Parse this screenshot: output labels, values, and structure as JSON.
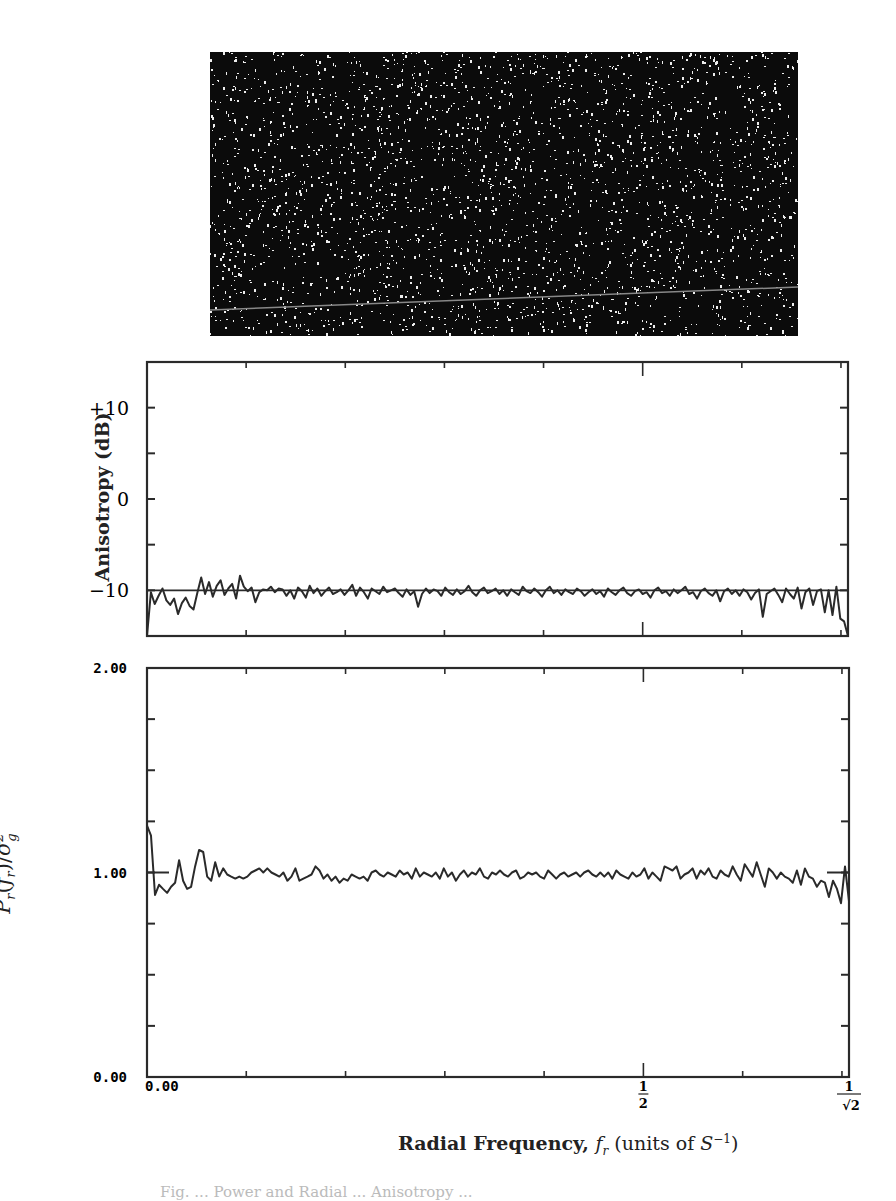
{
  "figure": {
    "image_panel": {
      "description": "random-dot noise texture (white speckles on black) with a faint gray diagonal line near the bottom"
    },
    "xlabel": "Radial Frequency, f_r (units of S^-1)",
    "xlabel_parts": {
      "main": "Radial Frequency, ",
      "var": "f",
      "sub": "r",
      "units_open": " (units of ",
      "unit_var": "S",
      "unit_sup": "−1",
      "units_close": ")"
    },
    "caption_partial": "Fig. ... Power and Radial ... Anisotropy ..."
  },
  "chart_data": [
    {
      "type": "line",
      "title": "",
      "ylabel": "Anisotropy (dB)",
      "xlabel": "",
      "ylim": [
        -15,
        15
      ],
      "xlim": [
        0,
        0.7071
      ],
      "yticks": [
        {
          "value": 10,
          "label": "+10"
        },
        {
          "value": 0,
          "label": "0"
        },
        {
          "value": -10,
          "label": "−10"
        }
      ],
      "yminor": [
        15,
        5,
        -5,
        -15
      ],
      "xticks": [
        0,
        0.1,
        0.2,
        0.3,
        0.4,
        0.5,
        0.6,
        0.7,
        0.7071
      ],
      "reference_line": -10,
      "series": [
        {
          "name": "anisotropy",
          "x_start": 0.0,
          "x_step": 0.00354,
          "values": [
            -15,
            -10.2,
            -11.5,
            -10.6,
            -9.8,
            -11.1,
            -11.6,
            -10.9,
            -12.6,
            -11.4,
            -10.8,
            -11.7,
            -12.1,
            -10.3,
            -8.6,
            -10.4,
            -9.1,
            -10.7,
            -9.5,
            -8.9,
            -10.5,
            -9.8,
            -9.3,
            -10.9,
            -8.4,
            -9.6,
            -10.1,
            -9.7,
            -11.3,
            -10.2,
            -9.9,
            -10.0,
            -9.6,
            -10.2,
            -9.8,
            -9.9,
            -10.6,
            -10.0,
            -10.9,
            -9.7,
            -10.1,
            -10.8,
            -9.5,
            -10.3,
            -9.8,
            -10.6,
            -10.1,
            -9.7,
            -10.4,
            -10.2,
            -9.9,
            -10.5,
            -10.0,
            -9.4,
            -10.6,
            -9.7,
            -10.2,
            -10.9,
            -9.8,
            -10.1,
            -10.4,
            -9.6,
            -10.2,
            -10.0,
            -9.8,
            -10.3,
            -10.7,
            -9.9,
            -10.5,
            -10.1,
            -11.8,
            -10.4,
            -9.8,
            -10.3,
            -9.9,
            -10.1,
            -10.6,
            -9.7,
            -10.2,
            -10.5,
            -9.9,
            -10.4,
            -10.1,
            -9.5,
            -10.2,
            -10.6,
            -10.0,
            -9.7,
            -10.3,
            -10.1,
            -9.8,
            -10.4,
            -10.0,
            -10.6,
            -9.9,
            -10.2,
            -10.5,
            -9.6,
            -10.1,
            -10.3,
            -9.8,
            -10.2,
            -10.7,
            -10.0,
            -9.6,
            -10.3,
            -10.0,
            -10.5,
            -9.9,
            -10.2,
            -10.4,
            -9.8,
            -10.1,
            -10.6,
            -10.2,
            -9.9,
            -10.4,
            -10.1,
            -10.7,
            -9.8,
            -10.2,
            -10.5,
            -10.0,
            -9.7,
            -10.3,
            -10.6,
            -10.1,
            -9.9,
            -10.4,
            -10.2,
            -10.8,
            -10.0,
            -9.7,
            -10.3,
            -10.1,
            -10.6,
            -9.9,
            -10.3,
            -10.0,
            -9.6,
            -10.4,
            -10.2,
            -10.9,
            -10.1,
            -9.8,
            -10.3,
            -10.6,
            -10.0,
            -11.2,
            -10.1,
            -9.8,
            -10.4,
            -10.0,
            -10.6,
            -9.9,
            -10.2,
            -11.0,
            -10.3,
            -9.9,
            -12.9,
            -10.4,
            -10.1,
            -9.8,
            -10.5,
            -11.3,
            -9.8,
            -10.4,
            -10.9,
            -9.7,
            -12.0,
            -10.2,
            -9.8,
            -11.6,
            -10.1,
            -9.9,
            -12.4,
            -10.0,
            -12.7,
            -9.6,
            -13.1,
            -13.4,
            -15
          ]
        }
      ]
    },
    {
      "type": "line",
      "title": "",
      "ylabel": "P_r(f_r)/σ_g^2",
      "ylabel_parts": {
        "p": "P",
        "p_sub": "r",
        "open": "(",
        "f": "f",
        "f_sub": "r",
        "close": ")/",
        "sigma": "σ",
        "sigma_sup": "2",
        "sigma_sub": "g"
      },
      "xlabel": "Radial Frequency, f_r (units of S^-1)",
      "ylim": [
        0,
        2
      ],
      "xlim": [
        0,
        0.7071
      ],
      "yticks": [
        {
          "value": 2,
          "label": "2.00"
        },
        {
          "value": 1,
          "label": "1.00"
        },
        {
          "value": 0,
          "label": "0.00"
        }
      ],
      "yminor": [
        0.25,
        0.5,
        0.75,
        1.25,
        1.5,
        1.75
      ],
      "xticks": [
        {
          "value": 0,
          "label": "0.00"
        },
        {
          "value": 0.1,
          "label": ""
        },
        {
          "value": 0.2,
          "label": ""
        },
        {
          "value": 0.3,
          "label": ""
        },
        {
          "value": 0.4,
          "label": ""
        },
        {
          "value": 0.5,
          "label": "1/2"
        },
        {
          "value": 0.6,
          "label": ""
        },
        {
          "value": 0.7,
          "label": ""
        },
        {
          "value": 0.7071,
          "label": "1/√2"
        }
      ],
      "reference_line": 1.0,
      "series": [
        {
          "name": "normalized radial power",
          "x_start": 0.0,
          "x_step": 0.00354,
          "values": [
            1.23,
            1.18,
            0.89,
            0.94,
            0.92,
            0.9,
            0.93,
            0.95,
            1.06,
            0.96,
            0.92,
            0.93,
            1.03,
            1.11,
            1.1,
            0.98,
            0.96,
            1.05,
            0.98,
            1.02,
            0.99,
            0.98,
            0.97,
            0.98,
            0.97,
            0.98,
            1.0,
            1.01,
            1.02,
            1.0,
            1.02,
            1.0,
            0.99,
            0.98,
            1.0,
            0.96,
            0.98,
            1.02,
            0.96,
            0.97,
            0.98,
            0.99,
            1.03,
            1.01,
            0.97,
            0.99,
            0.96,
            0.98,
            0.95,
            0.97,
            0.96,
            0.99,
            0.98,
            0.97,
            0.98,
            0.96,
            1.0,
            1.01,
            0.99,
            0.98,
            1.0,
            0.99,
            0.98,
            1.01,
            0.99,
            1.0,
            0.97,
            1.02,
            0.98,
            1.0,
            0.99,
            0.98,
            1.0,
            0.97,
            1.02,
            0.98,
            1.0,
            0.96,
            0.99,
            1.01,
            0.98,
            1.0,
            0.99,
            1.02,
            0.98,
            0.97,
            1.0,
            0.99,
            1.01,
            0.99,
            0.98,
            1.0,
            1.01,
            0.97,
            0.98,
            1.0,
            0.99,
            1.0,
            0.98,
            0.97,
            1.01,
            0.99,
            0.97,
            0.99,
            1.0,
            0.98,
            0.99,
            1.0,
            0.98,
            1.0,
            1.01,
            0.99,
            0.98,
            1.0,
            0.98,
            1.0,
            0.97,
            1.01,
            0.99,
            0.98,
            0.97,
            1.0,
            0.98,
            0.99,
            1.02,
            0.97,
            1.0,
            0.98,
            0.96,
            1.03,
            1.02,
            1.01,
            1.03,
            0.97,
            0.99,
            1.0,
            1.02,
            0.97,
            1.01,
            0.99,
            1.02,
            0.98,
            0.97,
            1.01,
            0.99,
            0.98,
            1.03,
            0.99,
            0.96,
            1.04,
            1.01,
            0.98,
            1.05,
            0.99,
            0.93,
            1.02,
            1.0,
            0.97,
            1.0,
            0.98,
            0.97,
            0.95,
            1.01,
            0.94,
            1.02,
            0.98,
            0.97,
            0.93,
            0.96,
            0.95,
            0.88,
            0.96,
            0.92,
            0.85,
            1.03,
            0.86
          ]
        }
      ]
    }
  ]
}
